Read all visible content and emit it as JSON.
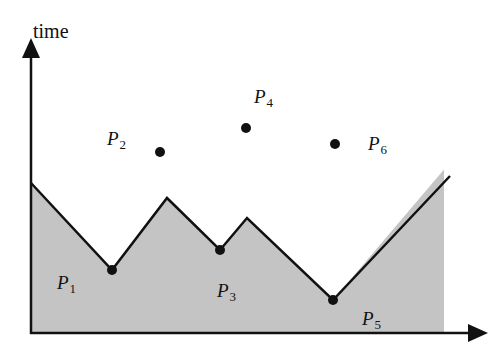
{
  "diagram": {
    "y_axis_label": "time",
    "colors": {
      "fill": "#c4c4c4",
      "line": "#111111",
      "points": "#111111",
      "background": "#ffffff"
    },
    "boundary_polyline": [
      [
        31,
        183
      ],
      [
        112,
        270
      ],
      [
        167,
        198
      ],
      [
        220,
        250
      ],
      [
        247,
        218
      ],
      [
        333,
        300
      ],
      [
        450,
        176
      ]
    ],
    "points": [
      {
        "id": "P1",
        "letter": "P",
        "subscript": "1",
        "x": 112,
        "y": 270,
        "label_x": 57,
        "label_y": 272,
        "on_boundary": true
      },
      {
        "id": "P2",
        "letter": "P",
        "subscript": "2",
        "x": 160,
        "y": 152,
        "label_x": 107,
        "label_y": 128,
        "on_boundary": false
      },
      {
        "id": "P3",
        "letter": "P",
        "subscript": "3",
        "x": 220,
        "y": 250,
        "label_x": 217,
        "label_y": 280,
        "on_boundary": true
      },
      {
        "id": "P4",
        "letter": "P",
        "subscript": "4",
        "x": 246,
        "y": 128,
        "label_x": 254,
        "label_y": 86,
        "on_boundary": false
      },
      {
        "id": "P5",
        "letter": "P",
        "subscript": "5",
        "x": 333,
        "y": 300,
        "label_x": 362,
        "label_y": 308,
        "on_boundary": true
      },
      {
        "id": "P6",
        "letter": "P",
        "subscript": "6",
        "x": 335,
        "y": 144,
        "label_x": 368,
        "label_y": 133,
        "on_boundary": false
      }
    ]
  }
}
